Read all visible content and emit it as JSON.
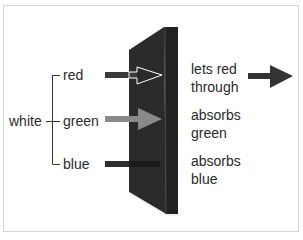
{
  "diagram": {
    "source_label": "white",
    "components": [
      {
        "label": "red",
        "arrow_color": "#3a3a3a",
        "result": "lets red through",
        "passes": true
      },
      {
        "label": "green",
        "arrow_color": "#8a8a8a",
        "result": "absorbs green",
        "passes": false
      },
      {
        "label": "blue",
        "arrow_color": "#2e2e2e",
        "result": "absorbs blue",
        "passes": false
      }
    ],
    "filter_colors": {
      "front": "#2b2b2b",
      "side": "#222222",
      "edge_highlight": "#f0f0f0"
    },
    "output_arrow_color": "#333333"
  }
}
